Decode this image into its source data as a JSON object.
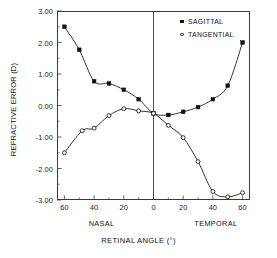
{
  "chart_data": {
    "type": "line",
    "title": "",
    "xlabel": "RETINAL ANGLE  (°)",
    "ylabel": "REFRACTIVE ERROR (D)",
    "xlim": [
      -65,
      65
    ],
    "ylim": [
      -3.0,
      3.0
    ],
    "yticks": [
      3.0,
      2.0,
      1.0,
      0.0,
      -1.0,
      -2.0,
      -3.0
    ],
    "ytick_labels": [
      "3.00",
      "2.00",
      "1.00",
      "0.00",
      "-1.00",
      "-2.00",
      "-3.00"
    ],
    "xticks": [
      -60,
      -40,
      -20,
      0,
      20,
      40,
      60
    ],
    "xtick_labels": [
      "60",
      "40",
      "20",
      "0",
      "20",
      "40",
      "60"
    ],
    "xminor_step": 10,
    "grid": false,
    "legend_position": "top-right",
    "region_labels": [
      {
        "text": "NASAL",
        "x": -35
      },
      {
        "text": "TEMPORAL",
        "x": 42
      }
    ],
    "annotations": [
      {
        "type": "vline",
        "x": 0,
        "label": "fovea-reference-line"
      }
    ],
    "series": [
      {
        "name": "SAGITTAL",
        "marker": "filled-square",
        "color": "#111111",
        "points": [
          {
            "x": -60,
            "y": 2.5
          },
          {
            "x": -50,
            "y": 1.77
          },
          {
            "x": -40,
            "y": 0.77
          },
          {
            "x": -30,
            "y": 0.7
          },
          {
            "x": -20,
            "y": 0.5
          },
          {
            "x": -10,
            "y": 0.2
          },
          {
            "x": 0,
            "y": -0.25
          },
          {
            "x": 10,
            "y": -0.3
          },
          {
            "x": 20,
            "y": -0.2
          },
          {
            "x": 30,
            "y": -0.05
          },
          {
            "x": 40,
            "y": 0.2
          },
          {
            "x": 50,
            "y": 0.63
          },
          {
            "x": 60,
            "y": 2.0
          }
        ]
      },
      {
        "name": "TANGENTIAL",
        "marker": "open-circle",
        "color": "#111111",
        "points": [
          {
            "x": -60,
            "y": -1.5
          },
          {
            "x": -48,
            "y": -0.8
          },
          {
            "x": -40,
            "y": -0.72
          },
          {
            "x": -30,
            "y": -0.32
          },
          {
            "x": -20,
            "y": -0.1
          },
          {
            "x": -10,
            "y": -0.17
          },
          {
            "x": 0,
            "y": -0.25
          },
          {
            "x": 10,
            "y": -0.63
          },
          {
            "x": 20,
            "y": -1.02
          },
          {
            "x": 30,
            "y": -1.78
          },
          {
            "x": 40,
            "y": -2.73
          },
          {
            "x": 50,
            "y": -2.9
          },
          {
            "x": 60,
            "y": -2.77
          }
        ]
      }
    ]
  },
  "legend": {
    "entries": [
      {
        "label": "SAGITTAL"
      },
      {
        "label": "TANGENTIAL"
      }
    ]
  }
}
